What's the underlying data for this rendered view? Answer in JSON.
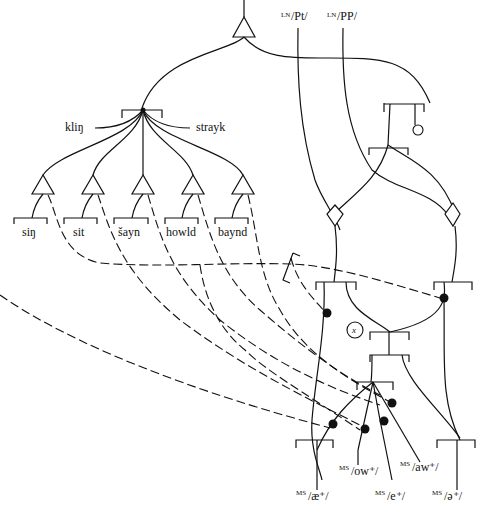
{
  "diagram": {
    "type": "stratificational relational network",
    "top_labels": [
      {
        "prefix": "LN",
        "text": "/Pt/"
      },
      {
        "prefix": "LN",
        "text": "/PP/"
      }
    ],
    "side_labels": {
      "left": "kliŋ",
      "right": "strayk"
    },
    "lexemes": [
      "siŋ",
      "sit",
      "šayn",
      "howld",
      "baynd"
    ],
    "bottom_labels": [
      {
        "prefix": "MS",
        "text": "/æ⁺/"
      },
      {
        "prefix": "MS",
        "text": "/ow⁺/"
      },
      {
        "prefix": "MS",
        "text": "/e⁺/"
      },
      {
        "prefix": "MS",
        "text": "/aw⁺/"
      },
      {
        "prefix": "MS",
        "text": "/ə⁺/"
      }
    ],
    "node_x_label": "x",
    "colors": {
      "ink": "#111111",
      "paper": "#ffffff"
    }
  }
}
